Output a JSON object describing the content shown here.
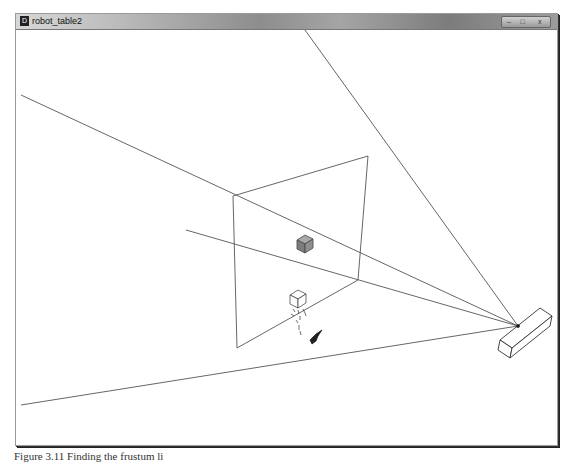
{
  "window": {
    "title": "robot_table2",
    "app_icon_glyph": "D",
    "controls": {
      "minimize": "–",
      "maximize": "□",
      "close": "x"
    }
  },
  "scene": {
    "line_color": "#555555",
    "cube_color": "#8a8a8a",
    "apex": [
      518,
      326
    ],
    "frustum_lines": [
      {
        "from": [
          305,
          30
        ],
        "to": [
          518,
          326
        ]
      },
      {
        "from": [
          21,
          95
        ],
        "to": [
          518,
          326
        ]
      },
      {
        "from": [
          186,
          230
        ],
        "to": [
          518,
          326
        ]
      },
      {
        "from": [
          21,
          405
        ],
        "to": [
          518,
          326
        ]
      }
    ],
    "near_plane": [
      [
        233,
        196
      ],
      [
        368,
        156
      ],
      [
        358,
        280
      ],
      [
        237,
        348
      ]
    ]
  },
  "caption": "Figure 3.11 Finding the frustum li"
}
